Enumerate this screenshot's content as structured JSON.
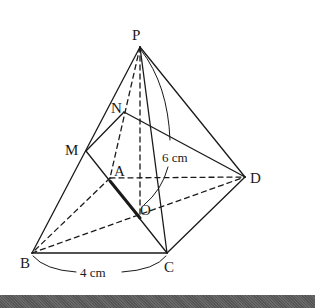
{
  "figure": {
    "type": "square pyramid with cross-section",
    "vertices": {
      "P": {
        "label": "P",
        "x": 140,
        "y": 47
      },
      "A": {
        "label": "A",
        "x": 110,
        "y": 178
      },
      "B": {
        "label": "B",
        "x": 32,
        "y": 253
      },
      "C": {
        "label": "C",
        "x": 167,
        "y": 253
      },
      "D": {
        "label": "D",
        "x": 245,
        "y": 177
      },
      "O": {
        "label": "O",
        "x": 140,
        "y": 218
      },
      "M": {
        "label": "M",
        "x": 86,
        "y": 151
      },
      "N": {
        "label": "N",
        "x": 124,
        "y": 112
      }
    },
    "measurements": {
      "base_edge": "4 cm",
      "height": "6 cm"
    },
    "colors": {
      "line": "#1a1a1a",
      "background": "#ffffff",
      "bottom_bar": "#5e5e5e"
    }
  }
}
